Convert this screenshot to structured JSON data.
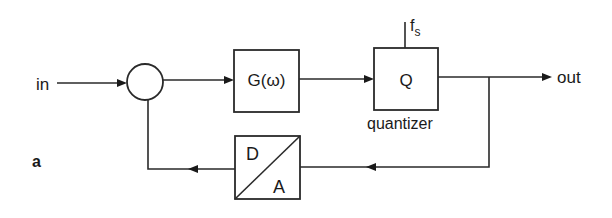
{
  "diagram": {
    "type": "block-diagram",
    "subfigure_label": "a",
    "input_label": "in",
    "output_label": "out",
    "summing_junction": {
      "shape": "circle"
    },
    "blocks": [
      {
        "id": "filter",
        "label": "G(ω)"
      },
      {
        "id": "quantizer",
        "label": "Q",
        "caption": "quantizer",
        "clock_input": {
          "label_base": "f",
          "label_sub": "s"
        }
      },
      {
        "id": "dac",
        "label_top": "D",
        "label_bottom": "A"
      }
    ],
    "connections": [
      {
        "from": "in",
        "to": "summing_junction"
      },
      {
        "from": "summing_junction",
        "to": "filter"
      },
      {
        "from": "filter",
        "to": "quantizer"
      },
      {
        "from": "quantizer",
        "to": "out"
      },
      {
        "from": "quantizer_output",
        "to": "dac",
        "path": "feedback"
      },
      {
        "from": "dac",
        "to": "summing_junction",
        "path": "feedback"
      }
    ]
  }
}
